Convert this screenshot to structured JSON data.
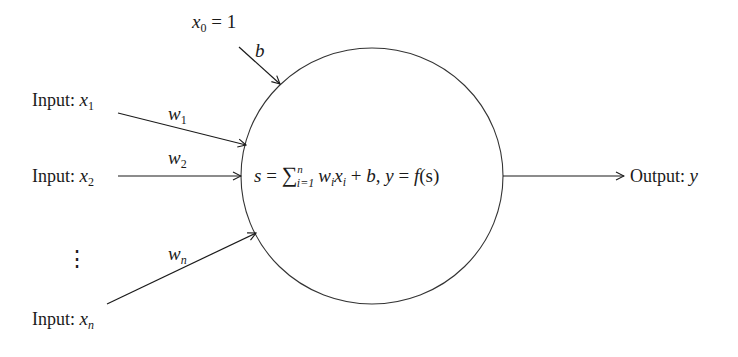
{
  "diagram": {
    "type": "perceptron-neuron",
    "bias_input": {
      "label_var": "x",
      "label_sub": "0",
      "label_rest": " = 1",
      "weight": "b"
    },
    "inputs": [
      {
        "prefix": "Input: ",
        "var": "x",
        "sub": "1",
        "weight_var": "w",
        "weight_sub": "1"
      },
      {
        "prefix": "Input: ",
        "var": "x",
        "sub": "2",
        "weight_var": "w",
        "weight_sub": "2"
      },
      {
        "prefix": "Input: ",
        "var": "x",
        "sub": "n",
        "weight_var": "w",
        "weight_sub": "n"
      }
    ],
    "ellipsis": "⋮",
    "neuron": {
      "s": "s",
      "eq": " = ",
      "sum": "∑",
      "sum_sup": "n",
      "sum_sub": "i=1",
      "w": "w",
      "wi": "i",
      "x": "x",
      "xi": "i",
      "plus": " + ",
      "b": "b",
      "comma": ", ",
      "y": "y",
      "eq2": " = ",
      "f": "f",
      "fs": "(s)"
    },
    "output": {
      "prefix": "Output: ",
      "var": "y"
    },
    "colors": {
      "stroke": "#1a1a1a",
      "background": "#ffffff"
    }
  }
}
